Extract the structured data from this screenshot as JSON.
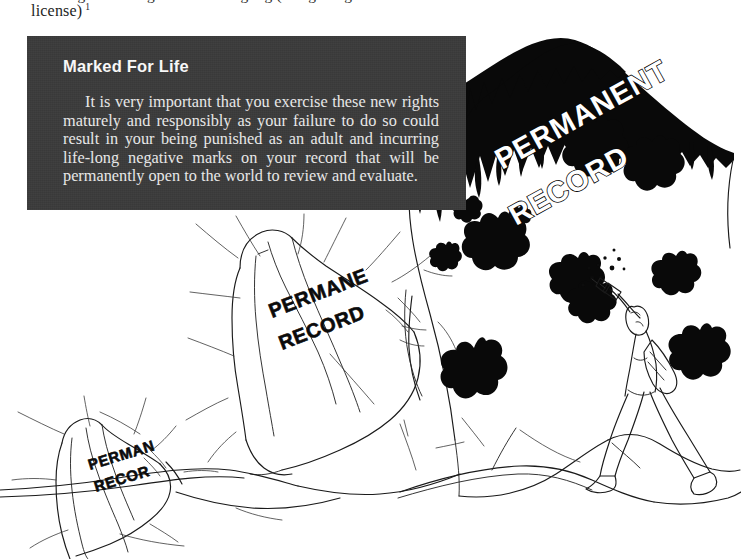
{
  "page": {
    "width": 741,
    "height": 559,
    "background": "#ffffff",
    "ink_color": "#1a1a1a"
  },
  "running_text": {
    "cropped_line": "standing on the edge of something big (and getting a driver's",
    "last_line": "license)",
    "footnote_marker": "1"
  },
  "callout": {
    "title": "Marked For Life",
    "body": "It is very important that you exercise these new rights maturely and responsibly as your failure to do so could result in your being punished as an adult and incurring life-long negative marks on your record that will be permanently open to the world to review and evaluate.",
    "background_color": "#3b3b3b",
    "text_color": "#f2f2f2",
    "title_color": "#fbfbfb"
  },
  "illustration": {
    "description": "Pen-and-ink drawing of three receding cliff faces tagged with graffiti reading PERMANENT RECORD, with a figure spray-painting the nearest cliff.",
    "cliffs": [
      {
        "id": "cliff-far-large",
        "graffiti_line_1": "PERMANENT",
        "graffiti_line_2": "RECORD",
        "style": "outlined",
        "position": "right-rear, largest, topped with black ridge"
      },
      {
        "id": "cliff-middle",
        "graffiti_line_1": "PERMANE",
        "graffiti_line_2": "RECORD",
        "style": "solid",
        "position": "center"
      },
      {
        "id": "cliff-near-small",
        "graffiti_line_1": "PERMAN",
        "graffiti_line_2": "RECOR",
        "style": "solid",
        "position": "lower-left, smallest"
      }
    ],
    "figure": {
      "id": "spray-painter",
      "holding": "spray-can",
      "second_item": "spray-can-at-hip",
      "action": "spraying cliff face"
    },
    "paint_blobs_count": 11
  }
}
